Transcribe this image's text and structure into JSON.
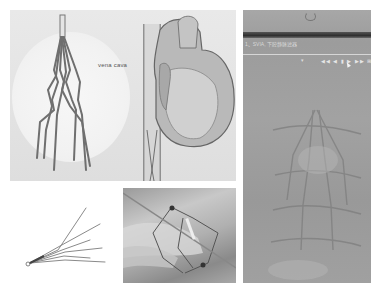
{
  "figure": {
    "panels": [
      {
        "id": "illustration",
        "description": "Illustration of vena cava filter and heart",
        "label": "vena cava"
      },
      {
        "id": "xray",
        "description": "Fluoroscopy image of filter in the inferior vena cava",
        "overlay_caption": "1、SVIA, 下腔静脉滤器",
        "toolbar_glyphs": "◀◀ ◀ ▮ ▶ ▶▶ ⊞"
      },
      {
        "id": "filter-drawing",
        "description": "Line drawing of a conical vena cava filter"
      },
      {
        "id": "photo",
        "description": "Photograph of filter device held in hand"
      }
    ]
  },
  "colors": {
    "background": "#ffffff",
    "illustration_bg": "#e4e4e4",
    "xray_bg": "#a0a0a0",
    "xray_bar": "#333333"
  }
}
